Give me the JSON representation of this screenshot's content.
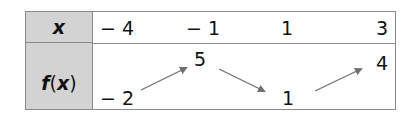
{
  "table": {
    "row_headers": {
      "x": "x",
      "fx_f": "f",
      "fx_open": "(",
      "fx_x": "x",
      "fx_close": ")"
    },
    "x_values": [
      "− 4",
      "− 1",
      "1",
      "3"
    ],
    "fx_values": [
      "− 2",
      "5",
      "1",
      "4"
    ],
    "arrows": [
      "up",
      "down",
      "up"
    ]
  }
}
